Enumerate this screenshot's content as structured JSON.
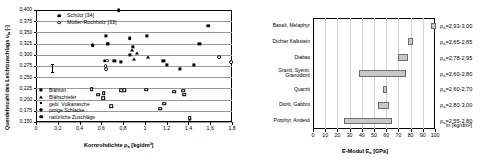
{
  "chart_data": [
    {
      "type": "scatter",
      "id": "poisson-vs-density",
      "title": "",
      "xlabel": "Kornrohdichte ρa [kg/dm³]",
      "ylabel": "Querdehnzahl des Leichtzuschlags νla [-]",
      "xlim": [
        0,
        1.8
      ],
      "ylim": [
        0.15,
        0.4
      ],
      "xticks": [
        "0",
        "0,2",
        "0,4",
        "0,6",
        "0,8",
        "1",
        "1,2",
        "1,4",
        "1,6",
        "1,8"
      ],
      "xtick_values": [
        0,
        0.2,
        0.4,
        0.6,
        0.8,
        1.0,
        1.2,
        1.4,
        1.6,
        1.8
      ],
      "yticks": [
        "0,400",
        "0,375",
        "0,350",
        "0,325",
        "0,300",
        "0,275",
        "0,250",
        "0,225",
        "0,200",
        "0,175",
        "0,150"
      ],
      "ytick_values": [
        0.4,
        0.375,
        0.35,
        0.325,
        0.3,
        0.275,
        0.25,
        0.225,
        0.2,
        0.175,
        0.15
      ],
      "grid": true,
      "legend_position": "top-left",
      "source_legend": [
        {
          "label": "Schütz [34]",
          "marker": "filled-circle"
        },
        {
          "label": "Müller-Rochholz [33]",
          "marker": "open-circle"
        }
      ],
      "material_legend": [
        {
          "label": "Blähton",
          "marker": "filled-square"
        },
        {
          "label": "Blähschiefer",
          "marker": "filled-triangle"
        },
        {
          "label": "gebl. Vulkanasche",
          "marker": "filled-small-dot"
        },
        {
          "label": "porige Schlacke",
          "marker": "filled-diamond"
        },
        {
          "label": "natürliche Zuschläge",
          "marker": "filled-circle"
        }
      ],
      "series": [
        {
          "name": "Schütz [34] – Blähton (filled square)",
          "marker": "filled-square",
          "points": [
            {
              "x": 0.64,
              "y": 0.343
            },
            {
              "x": 0.66,
              "y": 0.324
            },
            {
              "x": 0.72,
              "y": 0.287
            },
            {
              "x": 0.78,
              "y": 0.285
            },
            {
              "x": 0.86,
              "y": 0.299
            },
            {
              "x": 0.89,
              "y": 0.317
            },
            {
              "x": 1.02,
              "y": 0.343
            },
            {
              "x": 1.17,
              "y": 0.287
            },
            {
              "x": 1.2,
              "y": 0.277
            },
            {
              "x": 1.32,
              "y": 0.268
            },
            {
              "x": 1.45,
              "y": 0.278
            },
            {
              "x": 1.5,
              "y": 0.325
            }
          ]
        },
        {
          "name": "Schütz [34] – Blähschiefer (filled triangle)",
          "marker": "filled-triangle",
          "points": [
            {
              "x": 0.88,
              "y": 0.31
            },
            {
              "x": 0.9,
              "y": 0.291
            },
            {
              "x": 0.93,
              "y": 0.305
            },
            {
              "x": 1.03,
              "y": 0.296
            }
          ]
        },
        {
          "name": "Schütz [34] – natürliche Zuschläge / weitere (filled circle)",
          "marker": "filled-circle",
          "points": [
            {
              "x": 0.76,
              "y": 0.4
            },
            {
              "x": 0.52,
              "y": 0.322
            },
            {
              "x": 0.63,
              "y": 0.287
            },
            {
              "x": 0.66,
              "y": 0.325
            },
            {
              "x": 0.86,
              "y": 0.337
            },
            {
              "x": 1.58,
              "y": 0.365
            }
          ]
        },
        {
          "name": "Müller-Rochholz [33] (open circle)",
          "marker": "open-circle",
          "points": [
            {
              "x": 0.655,
              "y": 0.287
            },
            {
              "x": 0.64,
              "y": 0.274
            },
            {
              "x": 0.645,
              "y": 0.268
            },
            {
              "x": 1.68,
              "y": 0.295
            },
            {
              "x": 1.79,
              "y": 0.283
            },
            {
              "x": 1.41,
              "y": 0.157
            }
          ]
        },
        {
          "name": "Müller-Rochholz [33] – porige Schlacke / Vulkanasche (open square)",
          "marker": "open-square",
          "points": [
            {
              "x": 0.51,
              "y": 0.223
            },
            {
              "x": 0.57,
              "y": 0.211
            },
            {
              "x": 0.62,
              "y": 0.214
            },
            {
              "x": 0.615,
              "y": 0.203
            },
            {
              "x": 0.69,
              "y": 0.185
            },
            {
              "x": 0.78,
              "y": 0.221
            },
            {
              "x": 0.81,
              "y": 0.221
            },
            {
              "x": 1.01,
              "y": 0.222
            },
            {
              "x": 1.14,
              "y": 0.18
            },
            {
              "x": 1.18,
              "y": 0.191
            },
            {
              "x": 1.27,
              "y": 0.218
            },
            {
              "x": 1.35,
              "y": 0.22
            },
            {
              "x": 1.36,
              "y": 0.211
            },
            {
              "x": 1.41,
              "y": 0.158
            }
          ]
        }
      ],
      "errorbar": {
        "x": 0.09,
        "y": 0.278,
        "half_height": 0.009
      }
    },
    {
      "type": "bar",
      "id": "emodul-rock-ranges",
      "orientation": "horizontal-range",
      "title": "",
      "xlabel": "E-Modul Ea [GPa]",
      "ylabel": "",
      "xlim": [
        0,
        100
      ],
      "xticks": [
        "0",
        "10",
        "20",
        "30",
        "40",
        "50",
        "60",
        "70",
        "80",
        "90",
        "100"
      ],
      "xtick_values": [
        0,
        10,
        20,
        30,
        40,
        50,
        60,
        70,
        80,
        90,
        100
      ],
      "grid": true,
      "unit_note": "in [kg/dm³]",
      "categories": [
        {
          "label": "Basalt, Melaphyr",
          "low": 97,
          "high": 100,
          "density": "ρa=2,93-3,00"
        },
        {
          "label": "Dichter Kalkstein",
          "low": 78,
          "high": 82,
          "density": "ρa=2,65-2,85"
        },
        {
          "label": "Diabas",
          "low": 70,
          "high": 78,
          "density": "ρa=2,78-2,95"
        },
        {
          "label": "Granit, Syenit,\nGranodiorit",
          "low": 38,
          "high": 76,
          "density": "ρa=2,60-2,80"
        },
        {
          "label": "Quarzit",
          "low": 57,
          "high": 61,
          "density": "ρa=2,60-2,70"
        },
        {
          "label": "Diorit, Gabbro",
          "low": 53,
          "high": 62,
          "density": "ρa=2,80-3,00"
        },
        {
          "label": "Porphyr, Andesit",
          "low": 25,
          "high": 65,
          "density": "ρa=2,55-2,80"
        }
      ]
    }
  ]
}
